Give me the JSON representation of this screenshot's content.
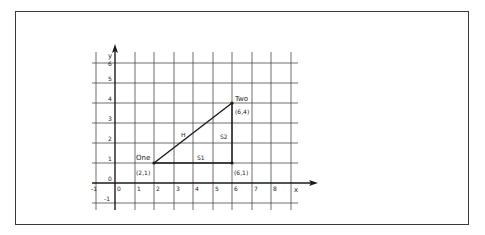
{
  "diagram": {
    "type": "coordinate-plane",
    "frame": {
      "stroke": "#3a3a3a"
    },
    "axes": {
      "x_label": "x",
      "y_label": "y",
      "x_ticks": [
        "-1",
        "0",
        "1",
        "2",
        "3",
        "4",
        "5",
        "6",
        "7",
        "8"
      ],
      "y_ticks": [
        "-1",
        "0",
        "1",
        "2",
        "3",
        "4",
        "5",
        "6"
      ],
      "x_range": [
        -1,
        9
      ],
      "y_range": [
        -1,
        6
      ]
    },
    "points": [
      {
        "name": "One",
        "coord_label": "(2,1)",
        "x": 2,
        "y": 1
      },
      {
        "name": "Two",
        "coord_label": "(6,4)",
        "x": 6,
        "y": 4
      },
      {
        "name": "",
        "coord_label": "(6,1)",
        "x": 6,
        "y": 1
      }
    ],
    "segments": [
      {
        "label": "H",
        "from": [
          2,
          1
        ],
        "to": [
          6,
          4
        ]
      },
      {
        "label": "S1",
        "from": [
          2,
          1
        ],
        "to": [
          6,
          1
        ]
      },
      {
        "label": "S2",
        "from": [
          6,
          1
        ],
        "to": [
          6,
          4
        ]
      }
    ],
    "colors": {
      "grid": "#4a4a4a",
      "ink": "#1a1a1a"
    }
  }
}
